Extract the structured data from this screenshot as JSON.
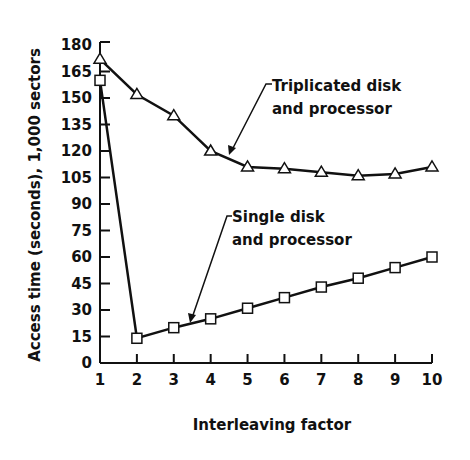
{
  "chart_data": {
    "type": "line",
    "title": "",
    "xlabel": "Interleaving factor",
    "ylabel": "Access time (seconds), 1,000 sectors",
    "x": [
      1,
      2,
      3,
      4,
      5,
      6,
      7,
      8,
      9,
      10
    ],
    "xticks": [
      "1",
      "2",
      "3",
      "4",
      "5",
      "6",
      "7",
      "8",
      "9",
      "10"
    ],
    "yticks": [
      "0",
      "15",
      "30",
      "45",
      "60",
      "75",
      "90",
      "105",
      "120",
      "135",
      "150",
      "165",
      "180"
    ],
    "xlim": [
      1,
      10
    ],
    "ylim": [
      0,
      180
    ],
    "grid": false,
    "legend": "none (inline annotations)",
    "series": [
      {
        "name": "Triplicated disk and processor",
        "marker": "triangle",
        "values": [
          172,
          152,
          140,
          120,
          111,
          110,
          108,
          106,
          107,
          111
        ]
      },
      {
        "name": "Single disk and processor",
        "marker": "square",
        "values": [
          160,
          14,
          20,
          25,
          31,
          37,
          43,
          48,
          54,
          60
        ]
      }
    ],
    "annotations": [
      {
        "text_line1": "Triplicated disk",
        "text_line2": "and processor",
        "points_to_series": 0
      },
      {
        "text_line1": "Single disk",
        "text_line2": "and processor",
        "points_to_series": 1
      }
    ]
  }
}
